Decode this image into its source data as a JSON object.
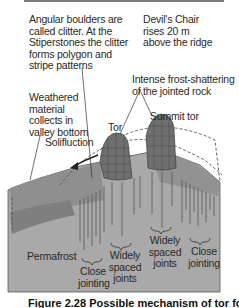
{
  "figure": {
    "caption": "Figure 2.28  Possible mechanism of tor formation",
    "labels": {
      "clitter_note": "Angular boulders are\ncalled clitter. At the\nStiperstones the clitter\nforms polygon and\nstripe patterns",
      "devils_chair_note": "Devil's Chair\nrises 20 m\nabove the ridge",
      "frost_shattering": "Intense frost-shattering\nof the jointed rock",
      "weathered_material": "Weathered\nmaterial\ncollects in\nvalley bottom",
      "tor": "Tor",
      "summit_tor": "Summit tor",
      "solifluction": "Solifluction",
      "permafrost": "Permafrost",
      "close_jointing_1": "Close\njointing",
      "widely_spaced_joints_1": "Widely\nspaced\njoints",
      "widely_spaced_joints_2": "Widely\nspaced\njoints",
      "close_jointing_2": "Close\njointing"
    },
    "colors": {
      "bedrock": "#a9a9a9",
      "regolith": "#8f8f8f",
      "upper_slope": "#9a9a9a",
      "tor_rock": "#6f6f6f",
      "line": "#3a3a3a",
      "background": "#ffffff"
    }
  }
}
